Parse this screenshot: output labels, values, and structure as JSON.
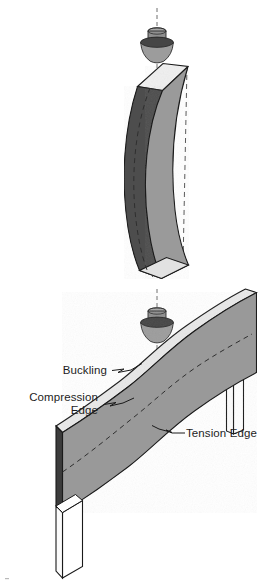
{
  "figure": {
    "background_color": "#ffffff",
    "line_color": "#1a1a1a"
  },
  "materials": {
    "face_front": "#9a9a9a",
    "face_front_lower": "#999999",
    "face_side_dark": "#4e4e4e",
    "face_top_light": "#efefef",
    "face_top_mid": "#d6d6d6",
    "face_white": "#ffffff",
    "loading_head_cap": "#8f8f8f",
    "loading_head_brim": "#454545",
    "loading_head_cone": "#9c9c9c",
    "dashed_line": "#6f6f6f"
  },
  "top_diagram": {
    "name": "vertical-column-buckling",
    "caption_visible": false,
    "parts": [
      {
        "id": "load-axis",
        "label": "load axis centerline",
        "style": "dashed"
      },
      {
        "id": "loading-head",
        "label": "conical loading head"
      },
      {
        "id": "column",
        "label": "buckled column"
      },
      {
        "id": "reference-lines",
        "label": "original straight position",
        "style": "dashed"
      }
    ]
  },
  "bottom_diagram": {
    "name": "inclined-beam-buckling",
    "parts": [
      {
        "id": "load-axis",
        "label": "load axis centerline",
        "style": "dashed"
      },
      {
        "id": "loading-head",
        "label": "conical loading head"
      },
      {
        "id": "beam",
        "label": "buckled inclined beam"
      },
      {
        "id": "support-left",
        "label": "left support post"
      },
      {
        "id": "support-right",
        "label": "right support post"
      },
      {
        "id": "neutral-axis",
        "label": "neutral axis",
        "style": "dashed"
      }
    ]
  },
  "labels": [
    {
      "id": "buckling",
      "text": "Buckling",
      "anchor": "end",
      "x": 107,
      "y": 373,
      "leader": {
        "from_x": 112,
        "from_y": 370,
        "to_x": 140,
        "to_y": 363,
        "style": "zigzag"
      }
    },
    {
      "id": "compression-edge",
      "text": "Compression",
      "text_line2": "Edge",
      "anchor": "end",
      "x": 98,
      "y": 400,
      "y2": 413,
      "leader": {
        "from_x": 104,
        "from_y": 404,
        "to_x": 132,
        "to_y": 399,
        "style": "zigzag"
      }
    },
    {
      "id": "tension-edge",
      "text": "Tension Edge",
      "anchor": "start",
      "x": 186,
      "y": 433,
      "leader": {
        "from_x": 184,
        "from_y": 429,
        "to_x": 158,
        "to_y": 424,
        "style": "zigzag"
      }
    }
  ]
}
